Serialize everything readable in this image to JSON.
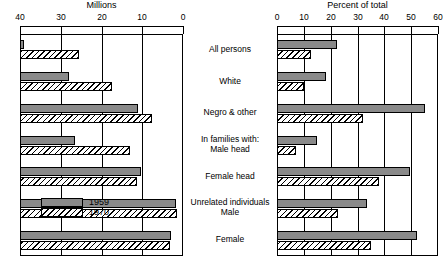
{
  "chart_data": {
    "type": "bar",
    "title": "",
    "orientation": "horizontal",
    "layout": "back-to-back paired panels",
    "grid": true,
    "legend_position": "lower-left of left panel",
    "categories": [
      "All persons",
      "White",
      "Negro & other",
      "In families with:\nMale head",
      "Female head",
      "Unrelated individuals\nMale",
      "Female"
    ],
    "legend": [
      "1959",
      "1970"
    ],
    "panels": [
      {
        "name": "left",
        "title": "Millions",
        "xlabel": "Millions",
        "ylabel": "",
        "xlim": [
          40,
          0
        ],
        "reversed": true,
        "ticks": [
          40,
          30,
          20,
          10,
          0
        ],
        "tick_labels": [
          "40",
          "30",
          "20",
          "10",
          "0"
        ],
        "series": [
          {
            "name": "1959",
            "values": [
              39.0,
              28.0,
              11.0,
              26.5,
              10.4,
              1.7,
              3.0
            ]
          },
          {
            "name": "1970",
            "values": [
              25.5,
              17.5,
              7.6,
              13.0,
              11.4,
              1.4,
              3.2
            ]
          }
        ]
      },
      {
        "name": "right",
        "title": "Percent of total",
        "xlabel": "Percent of total",
        "ylabel": "",
        "xlim": [
          0,
          60
        ],
        "reversed": false,
        "ticks": [
          0,
          10,
          20,
          30,
          40,
          50,
          60
        ],
        "tick_labels": [
          "0",
          "10",
          "20",
          "30",
          "40",
          "50",
          "60"
        ],
        "series": [
          {
            "name": "1959",
            "values": [
              22.4,
              18.1,
              55.1,
              15.0,
              49.4,
              33.5,
              52.3
            ]
          },
          {
            "name": "1970",
            "values": [
              12.6,
              9.9,
              32.0,
              7.1,
              38.1,
              22.6,
              35.0
            ]
          }
        ]
      }
    ]
  }
}
